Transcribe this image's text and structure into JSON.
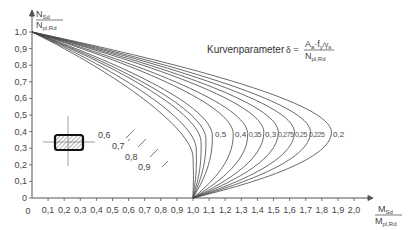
{
  "chart_data": {
    "type": "line",
    "title": "",
    "annotation": {
      "text": "Kurvenparameter",
      "formula": "δ = A_a·f_y/γ_a / N_pl,Rd",
      "formula_parts": {
        "delta": "δ =",
        "num_main": "A",
        "num_sub1": "a",
        "num_mid": "·f",
        "num_sub2": "y",
        "num_tail": "/γ",
        "num_sub3": "a",
        "den_main": "N",
        "den_sub": "pl,Rd"
      }
    },
    "xlabel": {
      "num": "M",
      "num_sub": "Sd",
      "den": "M",
      "den_sub": "pl,Rd"
    },
    "ylabel": {
      "num": "N",
      "num_sub": "Sd",
      "den": "N",
      "den_sub": "pl,Rd"
    },
    "xlim": [
      0,
      2.0
    ],
    "ylim": [
      0,
      1.0
    ],
    "x_ticks": [
      "0",
      "0,1",
      "0,2",
      "0,3",
      "0,4",
      "0,5",
      "0,6",
      "0,7",
      "0,8",
      "0,9",
      "1,0",
      "1,1",
      "1,2",
      "1,3",
      "1,4",
      "1,5",
      "1,6",
      "1,7",
      "1,8",
      "1,9",
      "2,0"
    ],
    "y_ticks": [
      "0",
      "0,1",
      "0,2",
      "0,3",
      "0,4",
      "0,5",
      "0,6",
      "0,7",
      "0,8",
      "0,9",
      "1,0"
    ],
    "grid": false,
    "series": [
      {
        "name": "0,9",
        "points": [
          [
            0,
            1.0
          ],
          [
            0.95,
            0.3
          ],
          [
            1.0,
            0
          ]
        ],
        "peak": [
          1.0,
          0.25
        ]
      },
      {
        "name": "0,8",
        "points": [
          [
            0,
            1.0
          ],
          [
            1.0,
            0.32
          ],
          [
            1.0,
            0
          ]
        ],
        "peak": [
          1.02,
          0.3
        ]
      },
      {
        "name": "0,7",
        "points": [
          [
            0,
            1.0
          ],
          [
            1.04,
            0.34
          ],
          [
            1.0,
            0
          ]
        ],
        "peak": [
          1.05,
          0.34
        ]
      },
      {
        "name": "0,6",
        "points": [
          [
            0,
            1.0
          ],
          [
            1.08,
            0.36
          ],
          [
            1.0,
            0
          ]
        ],
        "peak": [
          1.08,
          0.36
        ]
      },
      {
        "name": "0,5",
        "points": [
          [
            0,
            1.0
          ],
          [
            1.12,
            0.38
          ],
          [
            1.0,
            0
          ]
        ],
        "peak": [
          1.12,
          0.38
        ]
      },
      {
        "name": "0,4",
        "points": [
          [
            0,
            1.0
          ],
          [
            1.25,
            0.39
          ],
          [
            1.0,
            0
          ]
        ],
        "peak": [
          1.25,
          0.39
        ]
      },
      {
        "name": "0,35",
        "points": [
          [
            0,
            1.0
          ],
          [
            1.34,
            0.39
          ],
          [
            1.0,
            0
          ]
        ],
        "peak": [
          1.34,
          0.39
        ]
      },
      {
        "name": "0,3",
        "points": [
          [
            0,
            1.0
          ],
          [
            1.44,
            0.4
          ],
          [
            1.0,
            0
          ]
        ],
        "peak": [
          1.44,
          0.4
        ]
      },
      {
        "name": "0,275",
        "points": [
          [
            0,
            1.0
          ],
          [
            1.53,
            0.4
          ],
          [
            1.0,
            0
          ]
        ],
        "peak": [
          1.53,
          0.4
        ]
      },
      {
        "name": "0,25",
        "points": [
          [
            0,
            1.0
          ],
          [
            1.63,
            0.4
          ],
          [
            1.0,
            0
          ]
        ],
        "peak": [
          1.63,
          0.4
        ]
      },
      {
        "name": "0,225",
        "points": [
          [
            0,
            1.0
          ],
          [
            1.73,
            0.4
          ],
          [
            1.0,
            0
          ]
        ],
        "peak": [
          1.73,
          0.4
        ]
      },
      {
        "name": "0,2",
        "points": [
          [
            0,
            1.0
          ],
          [
            1.86,
            0.4
          ],
          [
            1.0,
            0
          ]
        ],
        "peak": [
          1.86,
          0.4
        ]
      }
    ],
    "curve_labels_right": [
      "0,5",
      "0,4",
      "0,35",
      "0,3",
      "0,275",
      "0,25",
      "0,225",
      "0,2"
    ],
    "curve_labels_left": [
      "0,6",
      "0,7",
      "0,8",
      "0,9"
    ],
    "inset_icon": "hatched-rectangular-cross-section"
  }
}
